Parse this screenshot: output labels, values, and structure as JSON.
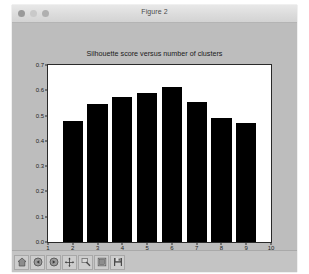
{
  "window": {
    "title": "Figure 2",
    "controls": [
      {
        "name": "close-button",
        "color": "#9a9a9a"
      },
      {
        "name": "minimize-button",
        "color": "#c9c9c9"
      },
      {
        "name": "maximize-button",
        "color": "#b0b0b0"
      }
    ]
  },
  "toolbar": {
    "buttons": [
      {
        "name": "home-button",
        "icon": "home-icon",
        "label": "Home"
      },
      {
        "name": "back-button",
        "icon": "back-arrow-icon",
        "label": "Back"
      },
      {
        "name": "forward-button",
        "icon": "forward-arrow-icon",
        "label": "Forward"
      },
      {
        "name": "pan-button",
        "icon": "pan-move-icon",
        "label": "Pan"
      },
      {
        "name": "zoom-button",
        "icon": "zoom-magnifier-icon",
        "label": "Zoom to rectangle"
      },
      {
        "name": "configure-subplots-button",
        "icon": "subplot-config-icon",
        "label": "Configure subplots"
      },
      {
        "name": "save-button",
        "icon": "floppy-disk-icon",
        "label": "Save the figure"
      }
    ]
  },
  "colors": {
    "figure_background": "#bdbdbd",
    "axes_background": "#ffffff",
    "bar_color": "#000000",
    "axis_line": "#2a2a2a",
    "window_chrome": "#dcdcdc",
    "toolbar_background": "#c4c4c4"
  },
  "chart_data": {
    "type": "bar",
    "title": "Silhouette score versus number of clusters",
    "xlabel": "",
    "ylabel": "",
    "categories": [
      "2",
      "3",
      "4",
      "5",
      "6",
      "7",
      "8",
      "9"
    ],
    "values": [
      0.48,
      0.545,
      0.575,
      0.59,
      0.615,
      0.555,
      0.49,
      0.47
    ],
    "x": [
      2,
      3,
      4,
      5,
      6,
      7,
      8,
      9
    ],
    "xlim": [
      1,
      10
    ],
    "ylim": [
      0.0,
      0.7
    ],
    "xticks": [
      1,
      2,
      3,
      4,
      5,
      6,
      7,
      8,
      9,
      10
    ],
    "xtick_labels": [
      "1",
      "2",
      "3",
      "4",
      "5",
      "6",
      "7",
      "8",
      "9",
      "10"
    ],
    "yticks": [
      0.0,
      0.1,
      0.2,
      0.3,
      0.4,
      0.5,
      0.6,
      0.7
    ],
    "ytick_labels": [
      "0.0",
      "0.1",
      "0.2",
      "0.3",
      "0.4",
      "0.5",
      "0.6",
      "0.7"
    ],
    "grid": false,
    "legend": null,
    "bar_width": 0.82
  }
}
